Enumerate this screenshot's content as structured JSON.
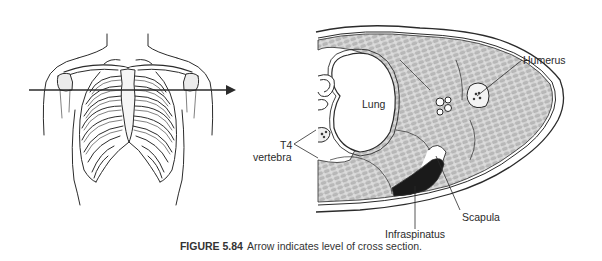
{
  "figure": {
    "caption": {
      "number": "FIGURE 5.84",
      "text": "Arrow indicates level of cross section."
    },
    "left_panel": {
      "subject": "anterior thorax with rib cage",
      "arrow_direction": "right",
      "arrow_meaning": "level of cross section"
    },
    "right_panel": {
      "subject": "transverse cross section at level of arrow",
      "labels": {
        "humerus": "Humerus",
        "lung": "Lung",
        "t4_line1": "T4",
        "t4_line2": "vertebra",
        "scapula": "Scapula",
        "infraspinatus": "Infraspinatus"
      }
    },
    "colors": {
      "line": "#2b2b2b",
      "muscle_fill": "#cfcfcf",
      "dark_muscle": "#1a1a1a",
      "background": "#ffffff"
    }
  }
}
